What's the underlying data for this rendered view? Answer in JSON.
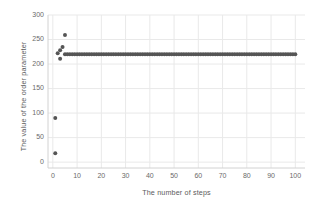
{
  "chart_data": {
    "type": "scatter",
    "title": "",
    "xlabel": "The number of steps",
    "ylabel": "The value of the order parameter",
    "xlim": [
      -2,
      104
    ],
    "ylim": [
      -12,
      300
    ],
    "xticks": [
      0,
      10,
      20,
      30,
      40,
      50,
      60,
      70,
      80,
      90,
      100
    ],
    "yticks": [
      0,
      50,
      100,
      150,
      200,
      250,
      300
    ],
    "grid": true,
    "legend": null,
    "marker_color": "#555555",
    "marker_size": 4,
    "series": [
      {
        "name": "order parameter",
        "points": [
          [
            1,
            18
          ],
          [
            1,
            90
          ],
          [
            2,
            222
          ],
          [
            3,
            228
          ],
          [
            3,
            211
          ],
          [
            4,
            235
          ],
          [
            5,
            259
          ],
          [
            5,
            220
          ],
          [
            6,
            220
          ],
          [
            7,
            220
          ],
          [
            8,
            220
          ],
          [
            9,
            220
          ],
          [
            10,
            220
          ],
          [
            11,
            220
          ],
          [
            12,
            220
          ],
          [
            13,
            220
          ],
          [
            14,
            220
          ],
          [
            15,
            220
          ],
          [
            16,
            220
          ],
          [
            17,
            220
          ],
          [
            18,
            220
          ],
          [
            19,
            220
          ],
          [
            20,
            220
          ],
          [
            21,
            220
          ],
          [
            22,
            220
          ],
          [
            23,
            220
          ],
          [
            24,
            220
          ],
          [
            25,
            220
          ],
          [
            26,
            220
          ],
          [
            27,
            220
          ],
          [
            28,
            220
          ],
          [
            29,
            220
          ],
          [
            30,
            220
          ],
          [
            31,
            220
          ],
          [
            32,
            220
          ],
          [
            33,
            220
          ],
          [
            34,
            220
          ],
          [
            35,
            220
          ],
          [
            36,
            220
          ],
          [
            37,
            220
          ],
          [
            38,
            220
          ],
          [
            39,
            220
          ],
          [
            40,
            220
          ],
          [
            41,
            220
          ],
          [
            42,
            220
          ],
          [
            43,
            220
          ],
          [
            44,
            220
          ],
          [
            45,
            220
          ],
          [
            46,
            220
          ],
          [
            47,
            220
          ],
          [
            48,
            220
          ],
          [
            49,
            220
          ],
          [
            50,
            220
          ],
          [
            51,
            220
          ],
          [
            52,
            220
          ],
          [
            53,
            220
          ],
          [
            54,
            220
          ],
          [
            55,
            220
          ],
          [
            56,
            220
          ],
          [
            57,
            220
          ],
          [
            58,
            220
          ],
          [
            59,
            220
          ],
          [
            60,
            220
          ],
          [
            61,
            220
          ],
          [
            62,
            220
          ],
          [
            63,
            220
          ],
          [
            64,
            220
          ],
          [
            65,
            220
          ],
          [
            66,
            220
          ],
          [
            67,
            220
          ],
          [
            68,
            220
          ],
          [
            69,
            220
          ],
          [
            70,
            220
          ],
          [
            71,
            220
          ],
          [
            72,
            220
          ],
          [
            73,
            220
          ],
          [
            74,
            220
          ],
          [
            75,
            220
          ],
          [
            76,
            220
          ],
          [
            77,
            220
          ],
          [
            78,
            220
          ],
          [
            79,
            220
          ],
          [
            80,
            220
          ],
          [
            81,
            220
          ],
          [
            82,
            220
          ],
          [
            83,
            220
          ],
          [
            84,
            220
          ],
          [
            85,
            220
          ],
          [
            86,
            220
          ],
          [
            87,
            220
          ],
          [
            88,
            220
          ],
          [
            89,
            220
          ],
          [
            90,
            220
          ],
          [
            91,
            220
          ],
          [
            92,
            220
          ],
          [
            93,
            220
          ],
          [
            94,
            220
          ],
          [
            95,
            220
          ],
          [
            96,
            220
          ],
          [
            97,
            220
          ],
          [
            98,
            220
          ],
          [
            99,
            220
          ],
          [
            100,
            220
          ]
        ]
      }
    ]
  },
  "style": {
    "background": "#ffffff",
    "grid_color": "#e9e9e9",
    "axis_color": "#d2d2d2",
    "tick_label_color": "#6a6a6a",
    "axis_title_color": "#5b5b5b"
  }
}
